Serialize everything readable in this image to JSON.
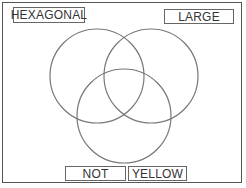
{
  "diagram": {
    "type": "venn",
    "sets": [
      {
        "id": "left",
        "cx": 97,
        "cy": 76,
        "r": 47
      },
      {
        "id": "right",
        "cx": 151,
        "cy": 76,
        "r": 47
      },
      {
        "id": "bottom",
        "cx": 124,
        "cy": 116,
        "r": 47
      }
    ],
    "stroke_color": "#777777"
  },
  "labels": {
    "hexagonal": "HEXAGONAL",
    "large": "LARGE",
    "not": "NOT",
    "yellow": "YELLOW"
  }
}
